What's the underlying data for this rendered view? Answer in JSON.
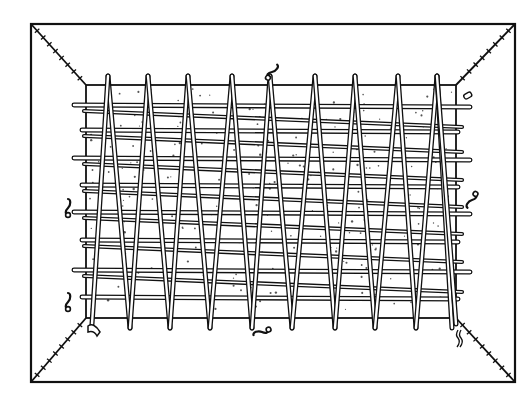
{
  "figure": {
    "colors": {
      "ink": "#111111",
      "paper": "#ffffff",
      "rod_fill": "#ffffff"
    },
    "outer_frame": {
      "x1": 31,
      "y1": 24,
      "x2": 515,
      "y2": 382
    },
    "inner_panel": {
      "x1": 86,
      "y1": 85,
      "x2": 456,
      "y2": 318
    },
    "stake_tops_x": [
      108,
      148,
      188,
      232,
      270,
      315,
      355,
      398,
      437
    ],
    "stake_bottoms_x": [
      130,
      170,
      210,
      252,
      292,
      335,
      375,
      416,
      452
    ],
    "horizontal_rod_rows_y": [
      105,
      130,
      158,
      185,
      212,
      240,
      270,
      297
    ],
    "small_objects": [
      {
        "name": "hook-top",
        "x": 272,
        "y": 72
      },
      {
        "name": "tag-top-right",
        "x": 468,
        "y": 96
      },
      {
        "name": "hook-right",
        "x": 472,
        "y": 200
      },
      {
        "name": "hook-left-upper",
        "x": 68,
        "y": 208
      },
      {
        "name": "hook-left-lower",
        "x": 68,
        "y": 302
      },
      {
        "name": "claw-bottom-left",
        "x": 94,
        "y": 330
      },
      {
        "name": "hook-bottom",
        "x": 262,
        "y": 332
      },
      {
        "name": "tassel-bottom-right",
        "x": 458,
        "y": 340
      }
    ]
  }
}
